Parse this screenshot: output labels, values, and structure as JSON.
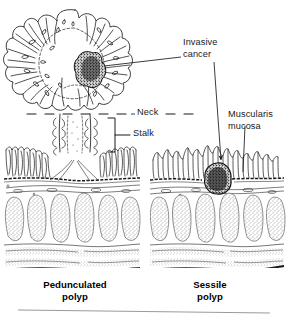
{
  "figure": {
    "style": "black-and-white medical line drawing, stippled histology",
    "ink_color": "#1a1a1a",
    "background_color": "#ffffff"
  },
  "callouts": {
    "invasive_cancer": {
      "line1": "Invasive",
      "line2": "cancer"
    },
    "neck": {
      "text": "Neck"
    },
    "stalk": {
      "text": "Stalk"
    },
    "muscularis_mucosa": {
      "line1": "Muscularis",
      "line2": "mucosa"
    }
  },
  "panels": [
    {
      "id": "pedunculated",
      "caption_line1": "Pedunculated",
      "caption_line2": "polyp",
      "features": [
        "villous polyp head",
        "invasive cancer focus in head",
        "neck",
        "stalk",
        "mucosa",
        "muscularis mucosa",
        "submucosa",
        "muscularis propria",
        "serosa"
      ]
    },
    {
      "id": "sessile",
      "caption_line1": "Sessile",
      "caption_line2": "polyp",
      "features": [
        "flat sessile mucosal surface",
        "invasive cancer mass below muscularis mucosa",
        "mucosa",
        "muscularis mucosa",
        "submucosa",
        "muscularis propria",
        "serosa"
      ]
    }
  ],
  "layers": {
    "mucosa": "mucosa",
    "muscularis_mucosa": "muscularis mucosa",
    "submucosa": "submucosa",
    "muscularis_propria": "muscularis propria",
    "serosa": "serosa"
  }
}
